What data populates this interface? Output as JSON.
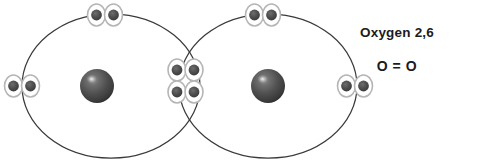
{
  "diagram": {
    "background_color": "#ffffff",
    "shell_stroke_color": "#3a3a3a",
    "nucleus_fill_color": "#4d4d4d",
    "nucleus_highlight_color": "#d8d8d8",
    "electron_dot_color": "#4a4a4a",
    "electron_ring_color": "#b5b5b5",
    "atoms": [
      {
        "name": "oxygen-atom-left",
        "element_symbol": "O",
        "shell_center_x": 111,
        "shell_center_y": 86,
        "shell_rx": 89,
        "shell_ry": 72,
        "nucleus_x": 97,
        "nucleus_y": 86,
        "nucleus_r": 17
      },
      {
        "name": "oxygen-atom-right",
        "element_symbol": "O",
        "shell_center_x": 268,
        "shell_center_y": 86,
        "shell_rx": 89,
        "shell_ry": 72,
        "nucleus_x": 268,
        "nucleus_y": 86,
        "nucleus_r": 17
      }
    ],
    "electron_pairs": [
      {
        "name": "lone-pair-left-outer",
        "x": 22,
        "y": 86,
        "orientation": "horizontal",
        "count": 2
      },
      {
        "name": "lone-pair-left-top",
        "x": 105,
        "y": 15,
        "orientation": "horizontal",
        "count": 2
      },
      {
        "name": "lone-pair-right-top",
        "x": 263,
        "y": 15,
        "orientation": "horizontal",
        "count": 2
      },
      {
        "name": "lone-pair-right-outer",
        "x": 355,
        "y": 86,
        "orientation": "horizontal",
        "count": 2
      }
    ],
    "shared_electrons": {
      "name": "shared-double-bond-electrons",
      "center_x": 185,
      "center_y": 80,
      "rows": 2,
      "columns": 2,
      "count": 4,
      "bond_type": "double bond"
    },
    "electron_dot_radius": 5.2,
    "electron_ring_radius": 8.2,
    "total_electrons_shown": 12
  },
  "labels": {
    "element_name_and_configuration": "Oxygen 2,6",
    "bond_formula": "O = O"
  }
}
